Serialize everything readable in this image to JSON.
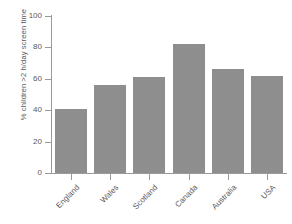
{
  "chart_data": {
    "type": "bar",
    "title": "",
    "subtitle": "",
    "xlabel": "",
    "ylabel": "% children >2 h/day screen time",
    "categories": [
      "England",
      "Wales",
      "Scotland",
      "Canada",
      "Australia",
      "USA"
    ],
    "values": [
      41,
      56,
      61,
      82,
      66,
      62
    ],
    "series": [
      {
        "name": "% children >2 h/day screen time",
        "values": [
          41,
          56,
          61,
          82,
          66,
          62
        ]
      }
    ],
    "ylim": [
      0,
      100
    ],
    "yticks": [
      0,
      20,
      40,
      60,
      80,
      100
    ],
    "ytick_labels": [
      "0",
      "20",
      "40",
      "60",
      "80",
      "100"
    ],
    "grid": false,
    "legend": false,
    "legend_position": "none",
    "bar_color": "#8e8e8e",
    "axis_color": "#9a9a9a",
    "background_color": "#ffffff",
    "xtick_label_rotation": -45,
    "annotations": []
  }
}
